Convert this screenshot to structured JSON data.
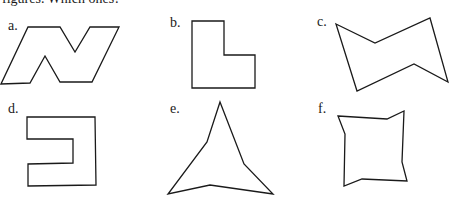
{
  "header": {
    "clipped_text": "figures. Which ones?"
  },
  "figures": [
    {
      "label": "a.",
      "label_pos": [
        8,
        18
      ],
      "points": "28,27 60,27 75,52 90,27 119,27 92,82 60,82 45,56 30,83 1,84"
    },
    {
      "label": "b.",
      "label_pos": [
        170,
        15
      ],
      "points": "192,21 224,21 224,55 255,55 255,88 192,88"
    },
    {
      "label": "c.",
      "label_pos": [
        317,
        14
      ],
      "points": "336,24 375,43 430,18 448,82 414,64 357,91"
    },
    {
      "label": "d.",
      "label_pos": [
        8,
        101
      ],
      "points": "27,117 95,117 96,185 28,186 28,164 73,163 73,139 27,139"
    },
    {
      "label": "e.",
      "label_pos": [
        170,
        101
      ],
      "points": "220,102 244,164 273,194 210,185 168,194 207,142"
    },
    {
      "label": "f.",
      "label_pos": [
        318,
        101
      ],
      "points": "338,116 387,119 404,111 402,162 407,181 362,179 344,186 345,134"
    }
  ]
}
